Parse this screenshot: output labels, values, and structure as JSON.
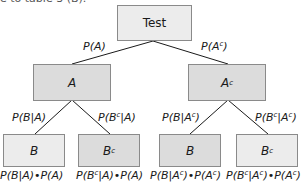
{
  "clipped_text": "e to table 3 (B).",
  "root": {
    "label": "Test"
  },
  "level1": [
    {
      "label": "A",
      "edge_label": "P(A)"
    },
    {
      "label": "A",
      "sup": "c",
      "edge_label": "P(A",
      "edge_sup": "c",
      "edge_close": ")"
    }
  ],
  "level2": [
    {
      "label": "B",
      "sup": "",
      "edge_label": "P(B|A)",
      "product": "P(B|A)•P(A)"
    },
    {
      "label": "B",
      "sup": "c",
      "edge_label": "P(B",
      "edge_sup": "c",
      "edge_rest": "|A)",
      "product_a": "P(B",
      "product_sup": "c",
      "product_b": "|A)•P(A)"
    },
    {
      "label": "B",
      "sup": "",
      "edge_label": "P(B|A",
      "edge_sup": "c",
      "edge_close": ")",
      "product_a": "P(B|A",
      "product_sup1": "c",
      "product_b": ")•P(A",
      "product_sup2": "c",
      "product_c": ")"
    },
    {
      "label": "B",
      "sup": "c",
      "edge_label": "P(B",
      "edge_sup": "c",
      "edge_mid": "|A",
      "edge_sup2": "c",
      "edge_close": ")",
      "product_a": "P(B",
      "product_sup1": "c",
      "product_b": "|A",
      "product_sup2": "c",
      "product_c": ")•P(A",
      "product_sup3": "c",
      "product_d": ")"
    }
  ],
  "colors": {
    "box_light": "#ececec",
    "box_mid": "#dcdcdc",
    "border": "#8a8a8a",
    "line": "#1a1a1a"
  }
}
